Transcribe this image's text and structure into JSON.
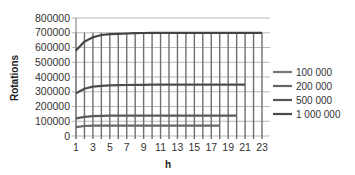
{
  "chart_data": {
    "type": "line",
    "title": "",
    "xlabel": "h",
    "ylabel": "Rotations",
    "ylim": [
      0,
      800000
    ],
    "yticks": [
      0,
      100000,
      200000,
      300000,
      400000,
      500000,
      600000,
      700000,
      800000
    ],
    "ytick_labels": [
      "0",
      "100000",
      "200000",
      "300000",
      "400000",
      "500000",
      "600000",
      "700000",
      "800000"
    ],
    "x": [
      1,
      2,
      3,
      4,
      5,
      6,
      7,
      8,
      9,
      10,
      11,
      12,
      13,
      14,
      15,
      16,
      17,
      18,
      19,
      20,
      21,
      22,
      23
    ],
    "xtick_labels": [
      "1",
      "3",
      "5",
      "7",
      "9",
      "11",
      "13",
      "15",
      "17",
      "19",
      "21",
      "23"
    ],
    "grid": true,
    "legend_position": "right",
    "series": [
      {
        "name": "100 000",
        "color": "#666666",
        "values": [
          60000,
          68000,
          70000,
          70000,
          70000,
          70000,
          70000,
          70000,
          70000,
          70000,
          70000,
          70000,
          70000,
          70000,
          70000,
          70000,
          70000,
          70000,
          null,
          null,
          null,
          null,
          null
        ]
      },
      {
        "name": "200 000",
        "color": "#5a5a5a",
        "values": [
          120000,
          130000,
          135000,
          137000,
          138000,
          138000,
          138000,
          138000,
          138000,
          138000,
          138000,
          138000,
          138000,
          138000,
          138000,
          138000,
          138000,
          138000,
          138000,
          138000,
          null,
          null,
          null
        ]
      },
      {
        "name": "500 000",
        "color": "#4d4d4d",
        "values": [
          290000,
          320000,
          335000,
          340000,
          343000,
          345000,
          346000,
          347000,
          347000,
          348000,
          348000,
          348000,
          348000,
          348000,
          348000,
          348000,
          348000,
          348000,
          348000,
          348000,
          348000,
          null,
          null
        ]
      },
      {
        "name": "1 000 000",
        "color": "#444444",
        "values": [
          580000,
          640000,
          670000,
          685000,
          690000,
          693000,
          695000,
          697000,
          698000,
          699000,
          700000,
          700000,
          700000,
          700000,
          700000,
          700000,
          700000,
          700000,
          700000,
          700000,
          700000,
          700000,
          700000
        ]
      }
    ]
  },
  "legend": {
    "items": [
      {
        "label": "100 000",
        "color": "#777777"
      },
      {
        "label": "200 000",
        "color": "#666666"
      },
      {
        "label": "500 000",
        "color": "#555555"
      },
      {
        "label": "1 000 000",
        "color": "#4a4a4a"
      }
    ]
  },
  "axes": {
    "ylabel": "Rotations",
    "xlabel": "h"
  },
  "colors": {
    "gridline": "#b8b8b8",
    "vgrid": "#6f6f6f",
    "axis": "#8a8a8a"
  }
}
